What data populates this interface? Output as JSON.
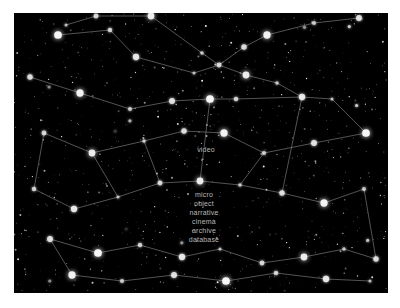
{
  "view": {
    "title": "star-map-constellation-view",
    "canvas": {
      "x": 14,
      "y": 13,
      "width": 374,
      "height": 280
    },
    "background_color": "#000000",
    "page_background": "#ffffff",
    "star_color": "#ffffff",
    "line_color": "#9a9a9a",
    "label_color": "#b9b9b9"
  },
  "labels": [
    {
      "text": "video",
      "x": 192,
      "y": 133,
      "align": "center"
    },
    {
      "text": "micro",
      "x": 190,
      "y": 178,
      "align": "center"
    },
    {
      "text": "object",
      "x": 190,
      "y": 187,
      "align": "center"
    },
    {
      "text": "narrative",
      "x": 190,
      "y": 196,
      "align": "center"
    },
    {
      "text": "cinema",
      "x": 190,
      "y": 205,
      "align": "center"
    },
    {
      "text": "archive",
      "x": 190,
      "y": 214,
      "align": "center"
    },
    {
      "text": "database",
      "x": 190,
      "y": 223,
      "align": "center"
    }
  ],
  "chart_data": {
    "type": "scatter",
    "xlabel": "",
    "ylabel": "",
    "xlim": [
      0,
      374
    ],
    "ylim": [
      0,
      280
    ],
    "grid": false,
    "legend": "none",
    "series": [
      {
        "name": "node-stars",
        "points": [
          [
            52,
            12
          ],
          [
            82,
            3
          ],
          [
            137,
            3
          ],
          [
            188,
            40
          ],
          [
            230,
            34
          ],
          [
            253,
            22
          ],
          [
            300,
            10
          ],
          [
            345,
            5
          ],
          [
            44,
            22
          ],
          [
            96,
            17
          ],
          [
            122,
            44
          ],
          [
            180,
            60
          ],
          [
            205,
            52
          ],
          [
            232,
            62
          ],
          [
            263,
            70
          ],
          [
            16,
            64
          ],
          [
            66,
            80
          ],
          [
            116,
            96
          ],
          [
            158,
            88
          ],
          [
            196,
            86
          ],
          [
            222,
            86
          ],
          [
            288,
            84
          ],
          [
            318,
            86
          ],
          [
            30,
            120
          ],
          [
            78,
            140
          ],
          [
            130,
            128
          ],
          [
            170,
            118
          ],
          [
            210,
            120
          ],
          [
            250,
            140
          ],
          [
            300,
            130
          ],
          [
            352,
            120
          ],
          [
            20,
            176
          ],
          [
            60,
            196
          ],
          [
            104,
            184
          ],
          [
            146,
            170
          ],
          [
            186,
            168
          ],
          [
            226,
            172
          ],
          [
            268,
            180
          ],
          [
            310,
            190
          ],
          [
            350,
            176
          ],
          [
            36,
            226
          ],
          [
            84,
            240
          ],
          [
            126,
            232
          ],
          [
            168,
            244
          ],
          [
            206,
            236
          ],
          [
            248,
            250
          ],
          [
            290,
            244
          ],
          [
            330,
            236
          ],
          [
            362,
            246
          ],
          [
            58,
            262
          ],
          [
            108,
            268
          ],
          [
            160,
            262
          ],
          [
            212,
            268
          ],
          [
            262,
            260
          ],
          [
            312,
            266
          ],
          [
            356,
            268
          ]
        ]
      },
      {
        "name": "edges",
        "segments": [
          [
            [
              52,
              12
            ],
            [
              82,
              3
            ]
          ],
          [
            [
              82,
              3
            ],
            [
              137,
              3
            ]
          ],
          [
            [
              137,
              3
            ],
            [
              188,
              40
            ]
          ],
          [
            [
              188,
              40
            ],
            [
              205,
              52
            ]
          ],
          [
            [
              205,
              52
            ],
            [
              230,
              34
            ]
          ],
          [
            [
              230,
              34
            ],
            [
              253,
              22
            ]
          ],
          [
            [
              253,
              22
            ],
            [
              300,
              10
            ]
          ],
          [
            [
              300,
              10
            ],
            [
              345,
              5
            ]
          ],
          [
            [
              44,
              22
            ],
            [
              96,
              17
            ]
          ],
          [
            [
              96,
              17
            ],
            [
              122,
              44
            ]
          ],
          [
            [
              122,
              44
            ],
            [
              180,
              60
            ]
          ],
          [
            [
              180,
              60
            ],
            [
              205,
              52
            ]
          ],
          [
            [
              205,
              52
            ],
            [
              232,
              62
            ]
          ],
          [
            [
              232,
              62
            ],
            [
              263,
              70
            ]
          ],
          [
            [
              263,
              70
            ],
            [
              288,
              84
            ]
          ],
          [
            [
              16,
              64
            ],
            [
              66,
              80
            ]
          ],
          [
            [
              66,
              80
            ],
            [
              116,
              96
            ]
          ],
          [
            [
              116,
              96
            ],
            [
              158,
              88
            ]
          ],
          [
            [
              158,
              88
            ],
            [
              196,
              86
            ]
          ],
          [
            [
              196,
              86
            ],
            [
              222,
              86
            ]
          ],
          [
            [
              222,
              86
            ],
            [
              288,
              84
            ]
          ],
          [
            [
              288,
              84
            ],
            [
              318,
              86
            ]
          ],
          [
            [
              318,
              86
            ],
            [
              352,
              120
            ]
          ],
          [
            [
              352,
              120
            ],
            [
              300,
              130
            ]
          ],
          [
            [
              300,
              130
            ],
            [
              250,
              140
            ]
          ],
          [
            [
              250,
              140
            ],
            [
              210,
              120
            ]
          ],
          [
            [
              210,
              120
            ],
            [
              170,
              118
            ]
          ],
          [
            [
              170,
              118
            ],
            [
              130,
              128
            ]
          ],
          [
            [
              130,
              128
            ],
            [
              78,
              140
            ]
          ],
          [
            [
              78,
              140
            ],
            [
              30,
              120
            ]
          ],
          [
            [
              30,
              120
            ],
            [
              20,
              176
            ]
          ],
          [
            [
              20,
              176
            ],
            [
              60,
              196
            ]
          ],
          [
            [
              60,
              196
            ],
            [
              104,
              184
            ]
          ],
          [
            [
              104,
              184
            ],
            [
              146,
              170
            ]
          ],
          [
            [
              146,
              170
            ],
            [
              186,
              168
            ]
          ],
          [
            [
              186,
              168
            ],
            [
              226,
              172
            ]
          ],
          [
            [
              226,
              172
            ],
            [
              268,
              180
            ]
          ],
          [
            [
              268,
              180
            ],
            [
              310,
              190
            ]
          ],
          [
            [
              310,
              190
            ],
            [
              350,
              176
            ]
          ],
          [
            [
              350,
              176
            ],
            [
              362,
              246
            ]
          ],
          [
            [
              362,
              246
            ],
            [
              330,
              236
            ]
          ],
          [
            [
              330,
              236
            ],
            [
              290,
              244
            ]
          ],
          [
            [
              290,
              244
            ],
            [
              248,
              250
            ]
          ],
          [
            [
              248,
              250
            ],
            [
              206,
              236
            ]
          ],
          [
            [
              206,
              236
            ],
            [
              168,
              244
            ]
          ],
          [
            [
              168,
              244
            ],
            [
              126,
              232
            ]
          ],
          [
            [
              126,
              232
            ],
            [
              84,
              240
            ]
          ],
          [
            [
              84,
              240
            ],
            [
              36,
              226
            ]
          ],
          [
            [
              36,
              226
            ],
            [
              58,
              262
            ]
          ],
          [
            [
              58,
              262
            ],
            [
              108,
              268
            ]
          ],
          [
            [
              108,
              268
            ],
            [
              160,
              262
            ]
          ],
          [
            [
              160,
              262
            ],
            [
              212,
              268
            ]
          ],
          [
            [
              212,
              268
            ],
            [
              262,
              260
            ]
          ],
          [
            [
              262,
              260
            ],
            [
              312,
              266
            ]
          ],
          [
            [
              312,
              266
            ],
            [
              356,
              268
            ]
          ],
          [
            [
              146,
              170
            ],
            [
              130,
              128
            ]
          ],
          [
            [
              186,
              168
            ],
            [
              196,
              86
            ]
          ],
          [
            [
              226,
              172
            ],
            [
              250,
              140
            ]
          ],
          [
            [
              268,
              180
            ],
            [
              288,
              84
            ]
          ],
          [
            [
              104,
              184
            ],
            [
              78,
              140
            ]
          ]
        ]
      }
    ]
  }
}
